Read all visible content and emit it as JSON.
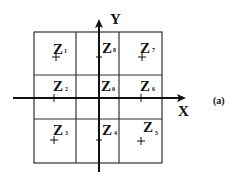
{
  "figure": {
    "label": "(a)",
    "axes": {
      "x_label": "X",
      "y_label": "Y"
    },
    "grid": {
      "rows": 3,
      "cols": 3
    },
    "zones": [
      {
        "id": "Z1",
        "letter": "Z",
        "sub": "1",
        "row": 0,
        "col": 0,
        "marker": true
      },
      {
        "id": "Z8",
        "letter": "Z",
        "sub": "8",
        "row": 0,
        "col": 1,
        "marker": true
      },
      {
        "id": "Z7",
        "letter": "Z",
        "sub": "7",
        "row": 0,
        "col": 2,
        "marker": true
      },
      {
        "id": "Z2",
        "letter": "Z",
        "sub": "2",
        "row": 1,
        "col": 0,
        "marker": true
      },
      {
        "id": "Z0",
        "letter": "Z",
        "sub": "0",
        "row": 1,
        "col": 1,
        "marker": false
      },
      {
        "id": "Z6",
        "letter": "Z",
        "sub": "6",
        "row": 1,
        "col": 2,
        "marker": true
      },
      {
        "id": "Z3",
        "letter": "Z",
        "sub": "3",
        "row": 2,
        "col": 0,
        "marker": true
      },
      {
        "id": "Z4",
        "letter": "Z",
        "sub": "4",
        "row": 2,
        "col": 1,
        "marker": true
      },
      {
        "id": "Z5",
        "letter": "Z",
        "sub": "5",
        "row": 2,
        "col": 2,
        "marker": true
      }
    ],
    "colors": {
      "line": "#222222",
      "text": "#111111",
      "background": "#ffffff"
    }
  }
}
